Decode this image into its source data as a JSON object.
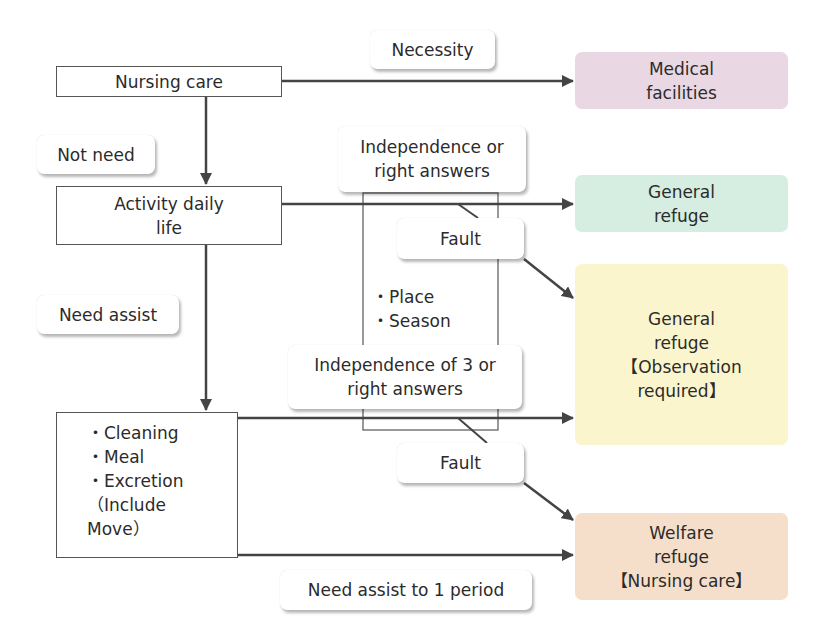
{
  "nodes": {
    "nursing_care": "Nursing care",
    "activity_daily_life": "Activity daily\nlife",
    "assist_tasks": {
      "items": [
        "・Cleaning",
        "・Meal",
        "・Excretion",
        "（Include",
        "Move）"
      ]
    },
    "condition_items": [
      "・Place",
      "・Season"
    ]
  },
  "labels": {
    "necessity": "Necessity",
    "not_need": "Not need",
    "need_assist": "Need assist",
    "independence_or_right": "Independence or\nright answers",
    "fault_1": "Fault",
    "independence_of_3": "Independence of 3 or\nright answers",
    "fault_2": "Fault",
    "need_assist_period": "Need assist to 1 period"
  },
  "destinations": {
    "medical": {
      "label": "Medical\nfacilities",
      "color": "#e9d8e3"
    },
    "general": {
      "label": "General\nrefuge",
      "color": "#d6ede2"
    },
    "general_observation": {
      "label": "General\nrefuge\n【Observation\nrequired】",
      "color": "#fbf5cd"
    },
    "welfare": {
      "label": "Welfare\nrefuge\n【Nursing care】",
      "color": "#f6dfca"
    }
  },
  "colors": {
    "line": "#444444",
    "box_border": "#555555"
  }
}
